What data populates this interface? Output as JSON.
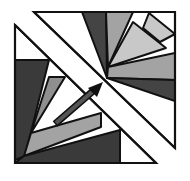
{
  "diagram": {
    "title": "",
    "colors": {
      "background": "#ffffff",
      "outline": "#111111",
      "dark": "#444444",
      "darker": "#3a3a3a",
      "medium": "#8f8f8f",
      "medium_light": "#a3a3a3",
      "light": "#c8c8c8",
      "white": "#ffffff",
      "arrow_shaft": "#555555",
      "arrow_head": "#111111"
    },
    "upper_triangle": {
      "points": "34,12 175,12 175,148",
      "regions": [
        {
          "name": "upper-dark-wedge",
          "points": "82,12 106,12 107,78",
          "fill": "dark"
        },
        {
          "name": "upper-medium-wedge",
          "points": "106,12 133,12 108,67",
          "fill": "medium_light"
        },
        {
          "name": "upper-light-triangle",
          "points": "133,22 166,48 108,67",
          "fill": "light"
        },
        {
          "name": "upper-light-square",
          "points": "149,13 175,34 160,42 143,28",
          "fill": "light"
        },
        {
          "name": "upper-medium-band",
          "points": "108,67 175,53 175,80 107,78",
          "fill": "medium_light"
        },
        {
          "name": "upper-dark-band",
          "points": "107,78 175,80 175,101",
          "fill": "dark"
        }
      ]
    },
    "lower_triangle": {
      "points": "15,25 15,163 156,163",
      "regions": [
        {
          "name": "lower-dark-left",
          "points": "15,60 49,60 25,156 15,160",
          "fill": "darker"
        },
        {
          "name": "lower-medium-wedge",
          "points": "49,77 65,77 31,133",
          "fill": "medium"
        },
        {
          "name": "lower-light-band",
          "points": "31,133 101,113 101,127 24,156",
          "fill": "medium_light"
        },
        {
          "name": "lower-dark-bottom",
          "points": "24,156 120,130 120,163 15,163",
          "fill": "darker"
        }
      ]
    },
    "arrow": {
      "from": [
        55,
        124
      ],
      "to": [
        102,
        83
      ],
      "head_points": "103,82 88,88 97,97"
    }
  }
}
